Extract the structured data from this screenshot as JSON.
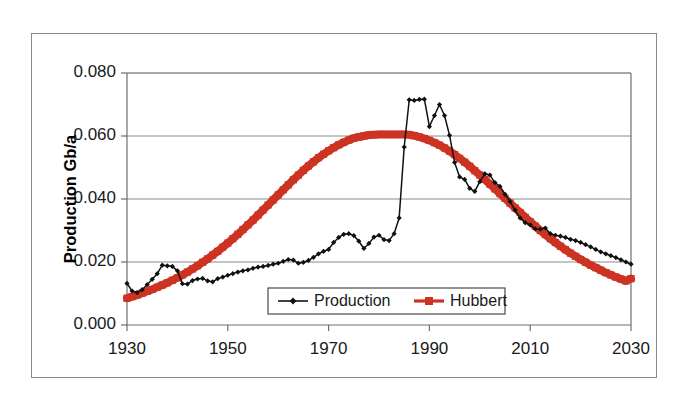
{
  "chart_data": {
    "type": "line",
    "title": "",
    "subtitle": "",
    "xlabel": "",
    "ylabel": "Production Gb/a",
    "xlim": [
      1930,
      2030
    ],
    "ylim": [
      0.0,
      0.08
    ],
    "grid": true,
    "grid_axis": "y",
    "legend_position": "bottom-center",
    "x_ticks": [
      1930,
      1950,
      1970,
      1990,
      2010,
      2030
    ],
    "x_tick_labels": [
      "1930",
      "1950",
      "1970",
      "1990",
      "2010",
      "2030"
    ],
    "y_ticks": [
      0.0,
      0.02,
      0.04,
      0.06,
      0.08
    ],
    "y_tick_labels": [
      "0.000",
      "0.020",
      "0.040",
      "0.060",
      "0.080"
    ],
    "colors": {
      "production": "#111111",
      "hubbert": "#CC3322",
      "grid": "#8a8a8a",
      "axis": "#6f6f6f",
      "frame": "#8a8a8a",
      "background": "#ffffff"
    },
    "series": [
      {
        "name": "Production",
        "color": "#111111",
        "marker": "diamond",
        "x": [
          1930,
          1931,
          1932,
          1933,
          1934,
          1935,
          1936,
          1937,
          1938,
          1939,
          1940,
          1941,
          1942,
          1943,
          1944,
          1945,
          1946,
          1947,
          1948,
          1949,
          1950,
          1951,
          1952,
          1953,
          1954,
          1955,
          1956,
          1957,
          1958,
          1959,
          1960,
          1961,
          1962,
          1963,
          1964,
          1965,
          1966,
          1967,
          1968,
          1969,
          1970,
          1971,
          1972,
          1973,
          1974,
          1975,
          1976,
          1977,
          1978,
          1979,
          1980,
          1981,
          1982,
          1983,
          1984,
          1985,
          1986,
          1987,
          1988,
          1989,
          1990,
          1991,
          1992,
          1993,
          1994,
          1995,
          1996,
          1997,
          1998,
          1999,
          2000,
          2001,
          2002,
          2003,
          2004,
          2005,
          2006,
          2007,
          2008,
          2009,
          2010,
          2011,
          2012,
          2013,
          2014,
          2015,
          2016,
          2017,
          2018,
          2019,
          2020,
          2021,
          2022,
          2023,
          2024,
          2025,
          2026,
          2027,
          2028,
          2029,
          2030
        ],
        "y": [
          0.0132,
          0.0108,
          0.0103,
          0.0112,
          0.0128,
          0.0145,
          0.0163,
          0.019,
          0.0188,
          0.0186,
          0.0172,
          0.0131,
          0.013,
          0.0141,
          0.0146,
          0.0148,
          0.014,
          0.0137,
          0.0147,
          0.0152,
          0.0158,
          0.0163,
          0.0168,
          0.0172,
          0.0175,
          0.018,
          0.0184,
          0.0186,
          0.0189,
          0.0193,
          0.0196,
          0.0202,
          0.0208,
          0.0206,
          0.0196,
          0.0199,
          0.0205,
          0.0215,
          0.0226,
          0.0234,
          0.024,
          0.0262,
          0.0278,
          0.0288,
          0.029,
          0.0284,
          0.0266,
          0.0243,
          0.0259,
          0.0279,
          0.0285,
          0.0271,
          0.0268,
          0.029,
          0.034,
          0.0565,
          0.0715,
          0.0713,
          0.0716,
          0.0717,
          0.063,
          0.0665,
          0.07,
          0.0665,
          0.0602,
          0.0516,
          0.047,
          0.0462,
          0.0434,
          0.0424,
          0.0455,
          0.048,
          0.0476,
          0.0452,
          0.044,
          0.0415,
          0.0392,
          0.0365,
          0.034,
          0.0325,
          0.0318,
          0.0305,
          0.0304,
          0.0308,
          0.029,
          0.0285,
          0.0282,
          0.0278,
          0.0272,
          0.0268,
          0.0262,
          0.0255,
          0.0248,
          0.024,
          0.0232,
          0.0226,
          0.022,
          0.0214,
          0.0207,
          0.02,
          0.0193
        ]
      },
      {
        "name": "Hubbert",
        "color": "#CC3322",
        "marker": "square",
        "x": [
          1930,
          1931,
          1932,
          1933,
          1934,
          1935,
          1936,
          1937,
          1938,
          1939,
          1940,
          1941,
          1942,
          1943,
          1944,
          1945,
          1946,
          1947,
          1948,
          1949,
          1950,
          1951,
          1952,
          1953,
          1954,
          1955,
          1956,
          1957,
          1958,
          1959,
          1960,
          1961,
          1962,
          1963,
          1964,
          1965,
          1966,
          1967,
          1968,
          1969,
          1970,
          1971,
          1972,
          1973,
          1974,
          1975,
          1976,
          1977,
          1978,
          1979,
          1980,
          1981,
          1982,
          1983,
          1984,
          1985,
          1986,
          1987,
          1988,
          1989,
          1990,
          1991,
          1992,
          1993,
          1994,
          1995,
          1996,
          1997,
          1998,
          1999,
          2000,
          2001,
          2002,
          2003,
          2004,
          2005,
          2006,
          2007,
          2008,
          2009,
          2010,
          2011,
          2012,
          2013,
          2014,
          2015,
          2016,
          2017,
          2018,
          2019,
          2020,
          2021,
          2022,
          2023,
          2024,
          2025,
          2026,
          2027,
          2028,
          2029,
          2030
        ],
        "y": [
          0.0085,
          0.009,
          0.0095,
          0.0101,
          0.0107,
          0.0113,
          0.012,
          0.0127,
          0.0134,
          0.0142,
          0.015,
          0.0159,
          0.0168,
          0.0178,
          0.0188,
          0.0199,
          0.021,
          0.0222,
          0.0234,
          0.0247,
          0.026,
          0.0274,
          0.0288,
          0.0303,
          0.0318,
          0.0333,
          0.0349,
          0.0365,
          0.0381,
          0.0397,
          0.0413,
          0.0429,
          0.0445,
          0.0461,
          0.0476,
          0.0491,
          0.0505,
          0.0518,
          0.0531,
          0.0542,
          0.0553,
          0.0563,
          0.0572,
          0.058,
          0.0587,
          0.0593,
          0.0597,
          0.06,
          0.0603,
          0.0604,
          0.0605,
          0.0605,
          0.0605,
          0.0605,
          0.0605,
          0.0605,
          0.0604,
          0.0601,
          0.0597,
          0.0592,
          0.0586,
          0.0579,
          0.0571,
          0.0562,
          0.0552,
          0.0541,
          0.0529,
          0.0517,
          0.0504,
          0.049,
          0.0476,
          0.0462,
          0.0447,
          0.0432,
          0.0417,
          0.0402,
          0.0387,
          0.0372,
          0.0357,
          0.0342,
          0.0328,
          0.0314,
          0.03,
          0.0287,
          0.0274,
          0.0262,
          0.025,
          0.0239,
          0.0228,
          0.0218,
          0.0208,
          0.0199,
          0.019,
          0.0182,
          0.0174,
          0.0166,
          0.0159,
          0.0152,
          0.0146,
          0.014,
          0.0147
        ]
      }
    ],
    "legend": [
      {
        "label": "Production",
        "color": "#111111",
        "marker": "diamond"
      },
      {
        "label": "Hubbert",
        "color": "#CC3322",
        "marker": "square"
      }
    ]
  }
}
